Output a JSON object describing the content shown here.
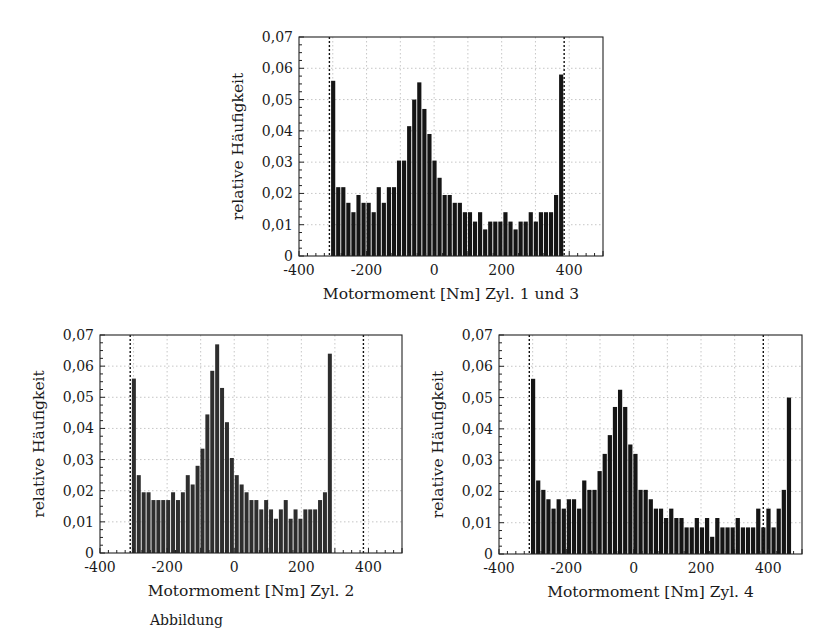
{
  "caption": "Abbildung",
  "chart_data": [
    {
      "id": "zyl13",
      "type": "bar",
      "title": "",
      "xlabel": "Motormoment [Nm] Zyl. 1 und 3",
      "ylabel": "relative Häufigkeit",
      "xlim": [
        -400,
        500
      ],
      "ylim": [
        0,
        0.07
      ],
      "xticks": [
        -400,
        -200,
        0,
        200,
        400
      ],
      "xtick_labels": [
        "-400",
        "-200",
        "0",
        "200",
        "400"
      ],
      "yticks": [
        0,
        0.01,
        0.02,
        0.03,
        0.04,
        0.05,
        0.06,
        0.07
      ],
      "ytick_labels": [
        "0",
        "0,01",
        "0,02",
        "0,03",
        "0,04",
        "0,05",
        "0,06",
        "0,07"
      ],
      "grid": true,
      "limit_lines": [
        -310,
        385
      ],
      "bin_start": -305,
      "bin_width": 15,
      "values": [
        0.056,
        0.022,
        0.022,
        0.017,
        0.014,
        0.0195,
        0.017,
        0.017,
        0.014,
        0.022,
        0.017,
        0.022,
        0.022,
        0.0305,
        0.0305,
        0.0415,
        0.05,
        0.0555,
        0.047,
        0.039,
        0.0305,
        0.025,
        0.0195,
        0.0195,
        0.017,
        0.017,
        0.014,
        0.014,
        0.011,
        0.014,
        0.0085,
        0.011,
        0.011,
        0.011,
        0.014,
        0.011,
        0.0085,
        0.011,
        0.011,
        0.014,
        0.011,
        0.014,
        0.014,
        0.014,
        0.0195,
        0.058
      ],
      "box": {
        "left": 299,
        "top": 37,
        "width": 304,
        "height": 219
      }
    },
    {
      "id": "zyl2",
      "type": "bar",
      "title": "",
      "xlabel": "Motormoment [Nm] Zyl. 2",
      "ylabel": "relative Häufigkeit",
      "xlim": [
        -400,
        500
      ],
      "ylim": [
        0,
        0.07
      ],
      "xticks": [
        -400,
        -200,
        0,
        200,
        400
      ],
      "xtick_labels": [
        "-400",
        "-200",
        "0",
        "200",
        "400"
      ],
      "yticks": [
        0,
        0.01,
        0.02,
        0.03,
        0.04,
        0.05,
        0.06,
        0.07
      ],
      "ytick_labels": [
        "0",
        "0,01",
        "0,02",
        "0,03",
        "0,04",
        "0,05",
        "0,06",
        "0,07"
      ],
      "grid": true,
      "limit_lines": [
        -310,
        385
      ],
      "bin_start": -305,
      "bin_width": 14.6,
      "values": [
        0.056,
        0.025,
        0.0195,
        0.0195,
        0.017,
        0.017,
        0.017,
        0.017,
        0.0195,
        0.017,
        0.0195,
        0.025,
        0.022,
        0.028,
        0.0335,
        0.0445,
        0.0585,
        0.067,
        0.053,
        0.042,
        0.0305,
        0.025,
        0.022,
        0.0195,
        0.017,
        0.017,
        0.014,
        0.017,
        0.014,
        0.011,
        0.014,
        0.017,
        0.011,
        0.014,
        0.011,
        0.014,
        0.014,
        0.014,
        0.017,
        0.0195,
        0.064
      ],
      "box": {
        "left": 100,
        "top": 335,
        "width": 302,
        "height": 218
      }
    },
    {
      "id": "zyl4",
      "type": "bar",
      "title": "",
      "xlabel": "Motormoment [Nm] Zyl. 4",
      "ylabel": "relative Häufigkeit",
      "xlim": [
        -400,
        500
      ],
      "ylim": [
        0,
        0.07
      ],
      "xticks": [
        -400,
        -200,
        0,
        200,
        400
      ],
      "xtick_labels": [
        "-400",
        "-200",
        "0",
        "200",
        "400"
      ],
      "yticks": [
        0,
        0.01,
        0.02,
        0.03,
        0.04,
        0.05,
        0.06,
        0.07
      ],
      "ytick_labels": [
        "0",
        "0,01",
        "0,02",
        "0,03",
        "0,04",
        "0,05",
        "0,06",
        "0,07"
      ],
      "grid": true,
      "limit_lines": [
        -310,
        385
      ],
      "bin_start": -305,
      "bin_width": 15.2,
      "values": [
        0.056,
        0.0235,
        0.0205,
        0.0175,
        0.0145,
        0.0175,
        0.0145,
        0.0175,
        0.0175,
        0.0145,
        0.0235,
        0.0205,
        0.0205,
        0.0265,
        0.032,
        0.038,
        0.047,
        0.0525,
        0.047,
        0.035,
        0.032,
        0.0205,
        0.0205,
        0.0175,
        0.0145,
        0.0145,
        0.0115,
        0.0145,
        0.0115,
        0.0115,
        0.0085,
        0.0085,
        0.0115,
        0.0085,
        0.0115,
        0.0055,
        0.0115,
        0.0085,
        0.0085,
        0.0085,
        0.0115,
        0.0085,
        0.0085,
        0.0085,
        0.0145,
        0.0085,
        0.0145,
        0.0085,
        0.0145,
        0.0205,
        0.05
      ],
      "box": {
        "left": 499,
        "top": 335,
        "width": 303,
        "height": 219
      }
    }
  ]
}
